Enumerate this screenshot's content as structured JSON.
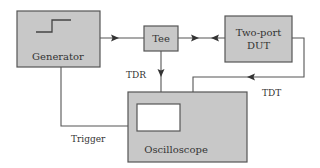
{
  "diagram": {
    "blocks": {
      "generator": {
        "label": "Generator"
      },
      "tee": {
        "label": "Tee"
      },
      "dut": {
        "label_line1": "Two-port",
        "label_line2": "DUT"
      },
      "oscilloscope": {
        "label": "Oscilloscope"
      }
    },
    "connections": {
      "tdr": {
        "label": "TDR"
      },
      "tdt": {
        "label": "TDT"
      },
      "trigger": {
        "label": "Trigger"
      }
    },
    "colors": {
      "box_fill": "#c8c8c8",
      "stroke": "#555555",
      "text": "#333333",
      "screen_fill": "#ffffff"
    }
  }
}
